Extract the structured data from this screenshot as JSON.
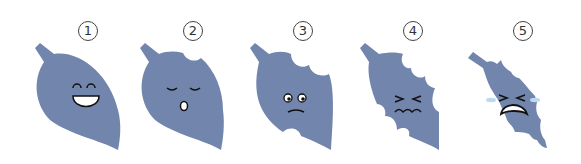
{
  "figure": {
    "leaf_color": "#7285AD",
    "tear_color": "#BCD9F2",
    "panels": [
      {
        "number": "1",
        "state": "whole leaf",
        "face": "laughing"
      },
      {
        "number": "2",
        "state": "one bite",
        "face": "sleepy / surprised"
      },
      {
        "number": "3",
        "state": "two bites",
        "face": "worried"
      },
      {
        "number": "4",
        "state": "many bites",
        "face": "squinting, pained"
      },
      {
        "number": "5",
        "state": "heavily eaten",
        "face": "crying"
      }
    ]
  }
}
